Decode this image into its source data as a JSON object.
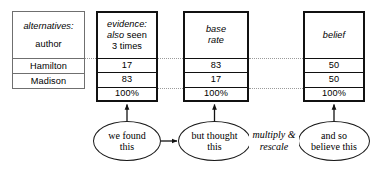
{
  "diagram": {
    "tables": [
      {
        "id": "alternatives",
        "style": "thin",
        "header_lines": [
          "alternatives:",
          "author"
        ],
        "rows": [
          "Hamilton",
          "Madison"
        ],
        "total": null
      },
      {
        "id": "evidence",
        "style": "thick",
        "header_lines": [
          "evidence:",
          "also seen",
          "3 times"
        ],
        "rows": [
          "17",
          "83"
        ],
        "total": "100%"
      },
      {
        "id": "base-rate",
        "style": "thick",
        "header_lines": [
          "base",
          "rate"
        ],
        "rows": [
          "83",
          "17"
        ],
        "total": "100%"
      },
      {
        "id": "belief",
        "style": "thick",
        "header_lines": [
          "belief"
        ],
        "rows": [
          "50",
          "50"
        ],
        "total": "100%"
      }
    ],
    "header_text": {
      "alternatives_label": "alternatives:",
      "author_label": "author",
      "evidence_label": "evidence:",
      "evidence_also": "also",
      "evidence_seen": "seen",
      "evidence_times": "3 times",
      "base_line1": "base",
      "base_line2": "rate",
      "belief_label": "belief"
    },
    "row_labels": {
      "hamilton": "Hamilton",
      "madison": "Madison"
    },
    "values": {
      "evidence_hamilton": "17",
      "evidence_madison": "83",
      "evidence_total": "100%",
      "base_hamilton": "83",
      "base_madison": "17",
      "base_total": "100%",
      "belief_hamilton": "50",
      "belief_madison": "50",
      "belief_total": "100%"
    },
    "nodes": [
      {
        "id": "found",
        "line1": "we found",
        "line2": "this"
      },
      {
        "id": "thought",
        "line1": "but thought",
        "line2": "this"
      },
      {
        "id": "believe",
        "line1": "and so",
        "line2": "believe this"
      }
    ],
    "node_text": {
      "found_line1": "we found",
      "found_line2": "this",
      "thought_line1": "but thought",
      "thought_line2": "this",
      "believe_line1": "and so",
      "believe_line2": "believe this"
    },
    "edges": [
      {
        "id": "found-to-thought",
        "label": ""
      },
      {
        "id": "thought-to-believe",
        "label_line1": "multiply &",
        "label_line2": "rescale"
      }
    ],
    "edge_labels": {
      "multiply_line1": "multiply &",
      "multiply_line2": "rescale"
    },
    "colors": {
      "thick_border": "#111111",
      "thin_border": "#6f6f6f",
      "dotted_connector": "#9a9a9a",
      "text": "#000000",
      "background": "#ffffff"
    }
  }
}
